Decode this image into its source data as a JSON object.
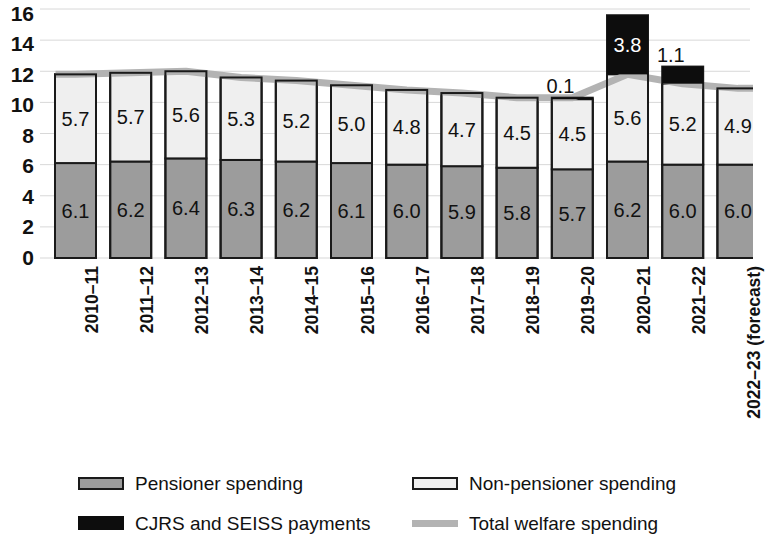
{
  "chart_data": {
    "type": "bar",
    "subtype": "stacked-bar-with-line",
    "title": "",
    "xlabel": "",
    "ylabel": "",
    "ylim": [
      0,
      16
    ],
    "ytick_step": 2,
    "yticks": [
      "16",
      "14",
      "12",
      "10",
      "8",
      "6",
      "4",
      "2",
      "0"
    ],
    "grid": true,
    "legend_position": "bottom",
    "categories": [
      "2010–11",
      "2011–12",
      "2012–13",
      "2013–14",
      "2014–15",
      "2015–16",
      "2016–17",
      "2017–18",
      "2018–19",
      "2019–20",
      "2020–21",
      "2021–22",
      "2022–23 (forecast)"
    ],
    "series": [
      {
        "name": "Pensioner spending",
        "color": "#9c9c9c",
        "values": [
          6.1,
          6.2,
          6.4,
          6.3,
          6.2,
          6.1,
          6.0,
          5.9,
          5.8,
          5.7,
          6.2,
          6.0,
          6.0
        ],
        "labels": [
          "6.1",
          "6.2",
          "6.4",
          "6.3",
          "6.2",
          "6.1",
          "6.0",
          "5.9",
          "5.8",
          "5.7",
          "6.2",
          "6.0",
          "6.0"
        ]
      },
      {
        "name": "Non-pensioner spending",
        "color": "#efefef",
        "values": [
          5.7,
          5.7,
          5.6,
          5.3,
          5.2,
          5.0,
          4.8,
          4.7,
          4.5,
          4.5,
          5.6,
          5.2,
          4.9
        ],
        "labels": [
          "5.7",
          "5.7",
          "5.6",
          "5.3",
          "5.2",
          "5.0",
          "4.8",
          "4.7",
          "4.5",
          "4.5",
          "5.6",
          "5.2",
          "4.9"
        ]
      },
      {
        "name": "CJRS and SEISS payments",
        "color": "#0d0d0d",
        "values": [
          0,
          0,
          0,
          0,
          0,
          0,
          0,
          0,
          0,
          0.1,
          3.8,
          1.1,
          0
        ],
        "labels": [
          "",
          "",
          "",
          "",
          "",
          "",
          "",
          "",
          "",
          "0.1",
          "3.8",
          "1.1",
          ""
        ]
      }
    ],
    "line_series": {
      "name": "Total welfare spending",
      "color": "#b3b3b3",
      "values": [
        11.8,
        11.9,
        12.0,
        11.6,
        11.4,
        11.1,
        10.8,
        10.6,
        10.3,
        10.3,
        11.8,
        11.2,
        10.9
      ]
    }
  },
  "legend": {
    "entries": [
      {
        "label": "Pensioner spending",
        "swatch": "pensioner-swatch"
      },
      {
        "label": "Non-pensioner spending",
        "swatch": "non-pensioner-swatch"
      },
      {
        "label": "CJRS and SEISS payments",
        "swatch": "cjrs-seiss-swatch"
      },
      {
        "label": "Total welfare spending",
        "swatch": "total-welfare-line-swatch"
      }
    ]
  }
}
